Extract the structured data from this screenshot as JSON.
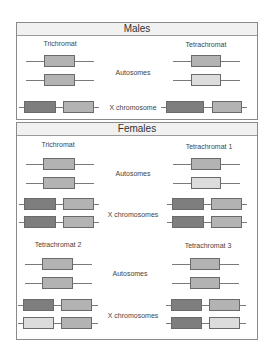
{
  "colors": {
    "dark": "#7e7e7e",
    "medium": "#b3b3b3",
    "light": "#dcdcdc",
    "border": "#8a8a8a",
    "header_bg": "#f1f1f1"
  },
  "males": {
    "title": "Males",
    "left_label": "Trichromat",
    "right_label": "Tetrachromat",
    "autosomes_label": "Autosomes",
    "x_label": "X chromosome",
    "trichromat": {
      "autosomes": [
        "medium",
        "medium"
      ],
      "x": [
        [
          "dark",
          "medium"
        ]
      ]
    },
    "tetrachromat": {
      "autosomes": [
        "medium",
        "light"
      ],
      "x": [
        [
          "dark",
          "medium"
        ]
      ]
    }
  },
  "females": {
    "title": "Females",
    "autosomes_label": "Autosomes",
    "x_label": "X chromosomes",
    "trichromat": {
      "label": "Trichromat",
      "autosomes": [
        "medium",
        "medium"
      ],
      "x": [
        [
          "dark",
          "medium"
        ],
        [
          "dark",
          "medium"
        ]
      ]
    },
    "tetrachromat1": {
      "label": "Tetrachromat 1",
      "autosomes": [
        "medium",
        "light"
      ],
      "x": [
        [
          "dark",
          "medium"
        ],
        [
          "dark",
          "medium"
        ]
      ]
    },
    "tetrachromat2": {
      "label": "Tetrachromat 2",
      "autosomes": [
        "medium",
        "medium"
      ],
      "x": [
        [
          "dark",
          "medium"
        ],
        [
          "light",
          "medium"
        ]
      ]
    },
    "tetrachromat3": {
      "label": "Tetrachromat 3",
      "autosomes": [
        "medium",
        "medium"
      ],
      "x": [
        [
          "dark",
          "medium"
        ],
        [
          "dark",
          "light"
        ]
      ]
    },
    "autosomes_label_2": "Autosomes",
    "x_label_2": "X chromosomes"
  }
}
